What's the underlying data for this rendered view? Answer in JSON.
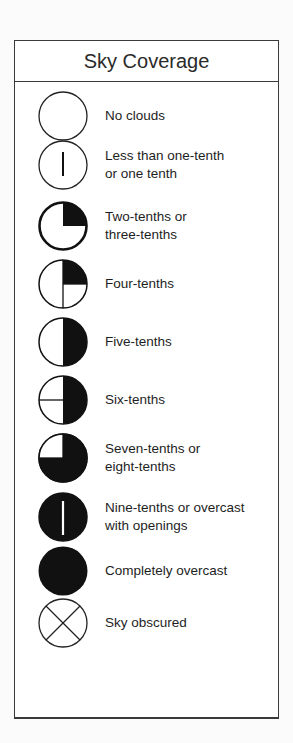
{
  "title": "Sky Coverage",
  "colors": {
    "border": "#3a3a3a",
    "symbol_fill": "#111111",
    "background": "#ffffff",
    "text": "#1e1e1e"
  },
  "items": [
    {
      "symbol": "clear-circle-icon",
      "label": "No clouds",
      "fraction": "0"
    },
    {
      "symbol": "vertical-line-circle-icon",
      "label": "Less than one-tenth\nor one tenth",
      "fraction": "≤1/10"
    },
    {
      "symbol": "quarter-filled-circle-icon",
      "label": "Two-tenths or\nthree-tenths",
      "fraction": "2-3/10"
    },
    {
      "symbol": "quarter-filled-crossline-circle-icon",
      "label": "Four-tenths",
      "fraction": "4/10"
    },
    {
      "symbol": "half-filled-circle-icon",
      "label": "Five-tenths",
      "fraction": "5/10"
    },
    {
      "symbol": "half-filled-crossline-circle-icon",
      "label": "Six-tenths",
      "fraction": "6/10"
    },
    {
      "symbol": "three-quarter-filled-circle-icon",
      "label": "Seven-tenths or\neight-tenths",
      "fraction": "7-8/10"
    },
    {
      "symbol": "filled-with-gap-circle-icon",
      "label": "Nine-tenths or overcast\nwith openings",
      "fraction": "9/10"
    },
    {
      "symbol": "filled-circle-icon",
      "label": "Completely overcast",
      "fraction": "10/10"
    },
    {
      "symbol": "x-circle-icon",
      "label": "Sky obscured",
      "fraction": "obscured"
    }
  ]
}
